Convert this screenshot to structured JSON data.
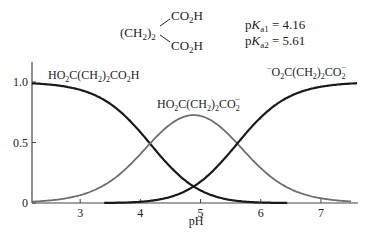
{
  "header": {
    "structure_left": "(CH2)2",
    "structure_top_group": "CO2H",
    "structure_bottom_group": "CO2H",
    "pka1_label": "pKa1 = 4.16",
    "pka2_label": "pKa2 = 5.61",
    "pka1": 4.16,
    "pka2": 5.61
  },
  "chart_data": {
    "type": "line",
    "xlabel": "pH",
    "ylabel": "",
    "xlim": [
      2.2,
      7.6
    ],
    "ylim": [
      0,
      1.0
    ],
    "x_ticks": [
      3,
      4,
      5,
      6,
      7
    ],
    "y_ticks": [
      0,
      0.5,
      1.0
    ],
    "y_tick_labels": [
      "0",
      "0.5",
      "1.0"
    ],
    "grid": false,
    "legend": "inline labels",
    "series": [
      {
        "name": "HO2C(CH2)2CO2H",
        "color": "#1a1a1a",
        "x": [
          2.2,
          3.0,
          3.5,
          4.0,
          4.16,
          4.5,
          5.0,
          5.5,
          6.0,
          6.45
        ],
        "values": [
          0.99,
          0.93,
          0.82,
          0.58,
          0.49,
          0.31,
          0.12,
          0.04,
          0.01,
          0.0
        ]
      },
      {
        "name": "HO2C(CH2)2CO2-",
        "color": "#6e6e6e",
        "x": [
          2.2,
          3.0,
          3.5,
          4.0,
          4.5,
          4.88,
          5.0,
          5.5,
          6.0,
          6.5,
          7.0,
          7.5
        ],
        "values": [
          0.01,
          0.06,
          0.18,
          0.4,
          0.65,
          0.74,
          0.73,
          0.59,
          0.35,
          0.12,
          0.04,
          0.0
        ]
      },
      {
        "name": "-O2C(CH2)2CO2-",
        "color": "#1a1a1a",
        "x": [
          3.4,
          4.0,
          4.5,
          4.88,
          5.0,
          5.5,
          5.61,
          6.0,
          6.5,
          7.0,
          7.6
        ],
        "values": [
          0.0,
          0.02,
          0.05,
          0.13,
          0.15,
          0.37,
          0.43,
          0.64,
          0.87,
          0.96,
          0.99
        ]
      }
    ],
    "labels": {
      "h2a": "HO2C(CH2)2CO2H",
      "ha": "HO2C(CH2)2CO2−",
      "a2": "−O2C(CH2)2CO2−"
    }
  }
}
